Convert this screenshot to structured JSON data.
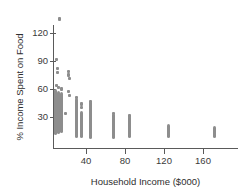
{
  "chart_data": {
    "type": "scatter",
    "title": "",
    "xlabel": "Household Income ($000)",
    "ylabel": "% Income Spent on Food",
    "xlim": [
      0,
      190
    ],
    "ylim": [
      0,
      142
    ],
    "xticks": [
      40,
      80,
      120,
      160
    ],
    "xtick_labels": [
      "40",
      "80",
      "120",
      "160"
    ],
    "yticks": [
      30,
      60,
      90,
      120
    ],
    "ytick_labels": [
      "30",
      "60",
      "90",
      "120"
    ],
    "grid": false,
    "legend": null,
    "marker_color": "#8d8d8d",
    "axis_color": "#5a5a5a",
    "background": "#ffffff",
    "columns": [
      {
        "x": 9,
        "y_min": 11,
        "y_max": 60,
        "dense": true
      },
      {
        "x": 12,
        "y_min": 12,
        "y_max": 58,
        "dense": true
      },
      {
        "x": 15,
        "y_min": 13,
        "y_max": 57,
        "dense": true
      },
      {
        "x": 30,
        "y_min": 8,
        "y_max": 50,
        "dense": true
      },
      {
        "x": 35,
        "y_min": 7,
        "y_max": 36,
        "dense": true
      },
      {
        "x": 45,
        "y_min": 6,
        "y_max": 47,
        "dense": true
      },
      {
        "x": 68,
        "y_min": 6,
        "y_max": 30,
        "dense": true
      },
      {
        "x": 85,
        "y_min": 7,
        "y_max": 31,
        "dense": true
      },
      {
        "x": 125,
        "y_min": 7,
        "y_max": 22,
        "dense": true
      },
      {
        "x": 172,
        "y_min": 7,
        "y_max": 20,
        "dense": true
      }
    ],
    "points": [
      {
        "x": 13,
        "y": 135
      },
      {
        "x": 10,
        "y": 92
      },
      {
        "x": 11,
        "y": 82
      },
      {
        "x": 11,
        "y": 78
      },
      {
        "x": 22,
        "y": 79
      },
      {
        "x": 22,
        "y": 75
      },
      {
        "x": 23,
        "y": 71
      },
      {
        "x": 10,
        "y": 64
      },
      {
        "x": 12,
        "y": 62
      },
      {
        "x": 15,
        "y": 60
      },
      {
        "x": 22,
        "y": 57
      },
      {
        "x": 23,
        "y": 53
      },
      {
        "x": 30,
        "y": 51
      },
      {
        "x": 35,
        "y": 44
      },
      {
        "x": 35,
        "y": 40
      },
      {
        "x": 45,
        "y": 47
      },
      {
        "x": 68,
        "y": 34
      },
      {
        "x": 68,
        "y": 31
      },
      {
        "x": 68,
        "y": 29
      },
      {
        "x": 85,
        "y": 31
      },
      {
        "x": 14,
        "y": 37
      },
      {
        "x": 19,
        "y": 34
      }
    ]
  },
  "axes": {
    "ylabel": "% Income Spent on Food",
    "xlabel": "Household Income ($000)"
  }
}
